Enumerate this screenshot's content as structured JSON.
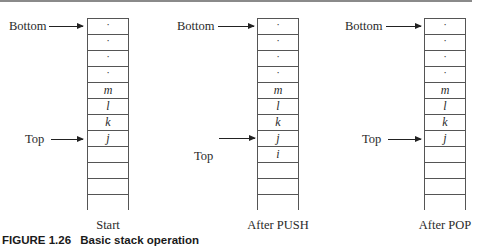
{
  "figure": {
    "number": "FIGURE 1.26",
    "title": "Basic stack operation"
  },
  "stacks": [
    {
      "caption": "Start",
      "bottom_label": "Bottom",
      "top_label": "Top",
      "top_points_to_cell": 7,
      "cells": [
        "·",
        "·",
        "·",
        "·",
        "m",
        "l",
        "k",
        "j",
        "",
        "",
        "",
        ""
      ]
    },
    {
      "caption": "After PUSH",
      "bottom_label": "Bottom",
      "top_label": "Top",
      "top_points_to_cell": 7,
      "cells": [
        "·",
        "·",
        "·",
        "·",
        "m",
        "l",
        "k",
        "j",
        "i",
        "",
        "",
        ""
      ]
    },
    {
      "caption": "After POP",
      "bottom_label": "Bottom",
      "top_label": "Top",
      "top_points_to_cell": 7,
      "cells": [
        "·",
        "·",
        "·",
        "·",
        "m",
        "l",
        "k",
        "j",
        "",
        "",
        "",
        ""
      ]
    }
  ]
}
